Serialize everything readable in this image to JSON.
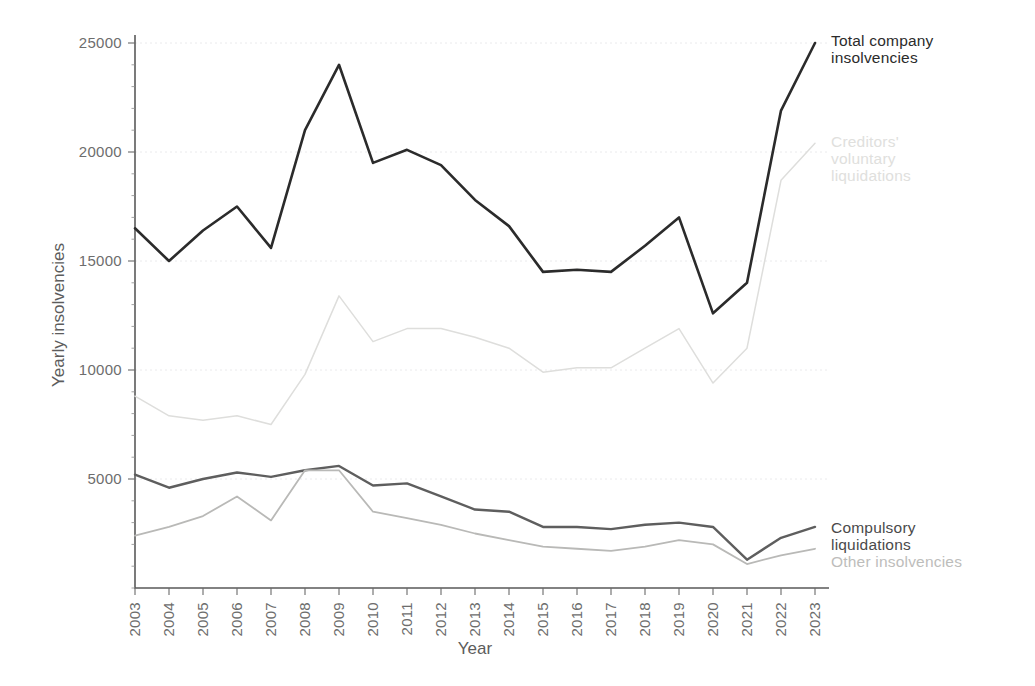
{
  "chart_data": {
    "type": "line",
    "title": "",
    "xlabel": "Year",
    "ylabel": "Yearly insolvencies",
    "x": [
      2003,
      2004,
      2005,
      2006,
      2007,
      2008,
      2009,
      2010,
      2011,
      2012,
      2013,
      2014,
      2015,
      2016,
      2017,
      2018,
      2019,
      2020,
      2021,
      2022,
      2023
    ],
    "categories": [
      "2003",
      "2004",
      "2005",
      "2006",
      "2007",
      "2008",
      "2009",
      "2010",
      "2011",
      "2012",
      "2013",
      "2014",
      "2015",
      "2016",
      "2017",
      "2018",
      "2019",
      "2020",
      "2021",
      "2022",
      "2023"
    ],
    "xlim": [
      2003,
      2023
    ],
    "ylim": [
      0,
      25500
    ],
    "yticks": [
      5000,
      10000,
      15000,
      20000,
      25000
    ],
    "ytick_labels": [
      "5000",
      "10000",
      "15000",
      "20000",
      "25000"
    ],
    "grid": true,
    "grid_axis": "y",
    "legend_position": "right-inline",
    "series": [
      {
        "name": "Total company insolvencies",
        "color": "#2b2b2b",
        "width": 2.6,
        "values": [
          16500,
          15000,
          16400,
          17500,
          15600,
          21000,
          24000,
          19500,
          20100,
          19400,
          17800,
          16600,
          14500,
          14600,
          14500,
          15700,
          17000,
          12600,
          14000,
          21900,
          25000
        ]
      },
      {
        "name": "Creditors' voluntary liquidations",
        "color": "#dededc",
        "width": 1.5,
        "values": [
          8800,
          7900,
          7700,
          7900,
          7500,
          9800,
          13400,
          11300,
          11900,
          11900,
          11500,
          11000,
          9900,
          10100,
          10100,
          11000,
          11900,
          9400,
          11000,
          18700,
          20400
        ]
      },
      {
        "name": "Compulsory liquidations",
        "color": "#5e5e5e",
        "width": 2.4,
        "values": [
          5200,
          4600,
          5000,
          5300,
          5100,
          5400,
          5600,
          4700,
          4800,
          4200,
          3600,
          3500,
          2800,
          2800,
          2700,
          2900,
          3000,
          2800,
          1300,
          2300,
          2800
        ]
      },
      {
        "name": "Other insolvencies",
        "color": "#b9b9b7",
        "width": 1.8,
        "values": [
          2400,
          2800,
          3300,
          4200,
          3100,
          5400,
          5400,
          3500,
          3200,
          2900,
          2500,
          2200,
          1900,
          1800,
          1700,
          1900,
          2200,
          2000,
          1100,
          1500,
          1800
        ]
      }
    ],
    "annotations": [
      {
        "text": "Total company\ninsolvencies",
        "color": "#2b2b2b",
        "x_px": 831,
        "y_px": 32
      },
      {
        "text": "Creditors'\nvoluntary\nliquidations",
        "color": "#e0e0dd",
        "x_px": 831,
        "y_px": 133
      },
      {
        "text": "Compulsory\nliquidations",
        "color": "#4a4a4a",
        "x_px": 831,
        "y_px": 519
      },
      {
        "text": "Other insolvencies",
        "color": "#bdbdbb",
        "x_px": 831,
        "y_px": 553
      }
    ]
  },
  "plot_geometry": {
    "left_px": 135,
    "right_px": 815,
    "top_px": 43,
    "bottom_px": 588,
    "y_top_value": 25000,
    "y_bottom_value": 0
  },
  "colors": {
    "background": "#ffffff",
    "axis": "#5a5a5a",
    "grid": "#e8e8ea",
    "tick_text": "#6d6d6d"
  }
}
